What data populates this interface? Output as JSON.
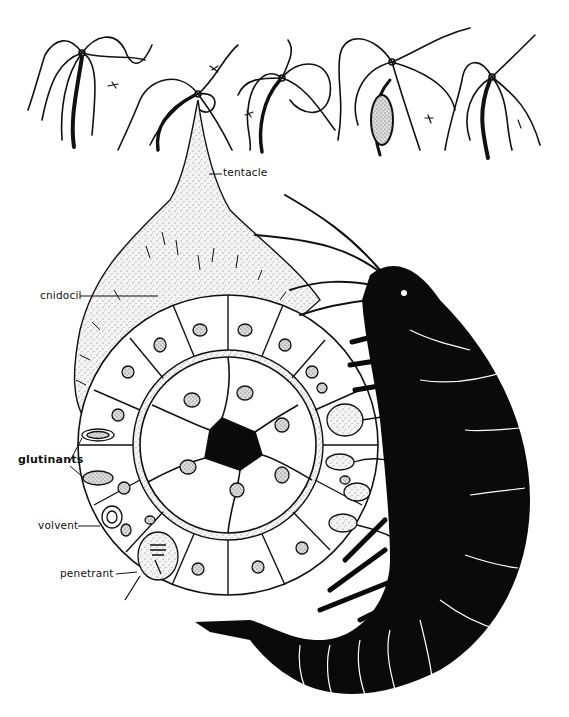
{
  "figure": {
    "top_row": {
      "description": "Five hydra polyps with tentacles capturing small prey",
      "polyp_count": 5
    },
    "labels": {
      "tentacle": "tentacle",
      "cnidocil": "cnidocil",
      "glutinants": "glutinants",
      "volvent": "volvent",
      "penetrant": "penetrant"
    },
    "colors": {
      "ink": "#111111",
      "paper": "#ffffff",
      "stipple": "#c8c8c8",
      "silhouette": "#0a0a0a"
    }
  }
}
